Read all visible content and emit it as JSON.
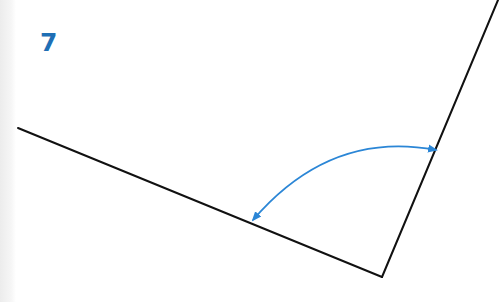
{
  "problem": {
    "number": "7"
  },
  "diagram": {
    "type": "angle",
    "vertex": [
      382,
      277
    ],
    "ray_left_end": [
      18,
      128
    ],
    "ray_right_end": [
      498,
      0
    ],
    "arc": {
      "start": [
        253,
        220
      ],
      "control": [
        330,
        130
      ],
      "end": [
        436,
        150
      ],
      "double_headed": true
    },
    "colors": {
      "line": "#111111",
      "arc": "#2b86d6",
      "number": "#1f6fb5"
    }
  }
}
